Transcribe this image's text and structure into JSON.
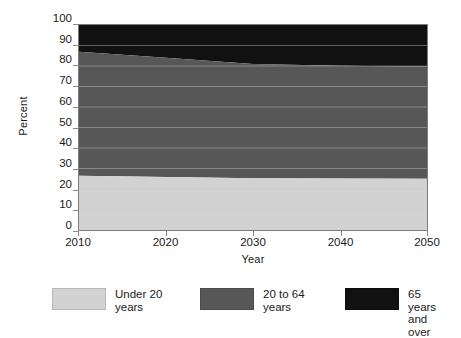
{
  "chart_data": {
    "type": "area",
    "stacked": true,
    "percent_stacked": true,
    "title": "",
    "subtitle": "",
    "xlabel": "Year",
    "ylabel": "Percent",
    "x": [
      2010,
      2020,
      2030,
      2040,
      2050
    ],
    "xlim": [
      2010,
      2050
    ],
    "ylim": [
      0,
      100
    ],
    "xticks": [
      "2010",
      "2020",
      "2030",
      "2040",
      "2050"
    ],
    "yticks": [
      "0",
      "10",
      "20",
      "30",
      "40",
      "50",
      "60",
      "70",
      "80",
      "90",
      "100"
    ],
    "grid": true,
    "grid_axis": "y",
    "legend_position": "bottom",
    "series": [
      {
        "name": "Under 20 years",
        "color": "#d2d2d2",
        "values": [
          26.5,
          25.8,
          25.3,
          25.1,
          25.0
        ]
      },
      {
        "name": "20 to 64 years",
        "color": "#575757",
        "values": [
          60.5,
          58.2,
          55.7,
          55.0,
          54.8
        ]
      },
      {
        "name": "65 years and over",
        "color": "#111111",
        "values": [
          13.0,
          16.0,
          19.0,
          19.9,
          20.2
        ]
      }
    ],
    "cumulative_upper_bounds": {
      "under_20": [
        26.5,
        25.8,
        25.3,
        25.1,
        25.0
      ],
      "through_64": [
        87.0,
        84.0,
        81.0,
        80.1,
        79.8
      ],
      "total": [
        100,
        100,
        100,
        100,
        100
      ]
    },
    "annotations": []
  },
  "axes": {
    "y_title": "Percent",
    "x_title": "Year",
    "y_ticklabels": [
      "100",
      "90",
      "80",
      "70",
      "60",
      "50",
      "40",
      "30",
      "20",
      "10",
      "0"
    ],
    "x_ticklabels": [
      "2010",
      "2020",
      "2030",
      "2040",
      "2050"
    ]
  },
  "legend": {
    "items": [
      {
        "label": "Under 20\nyears",
        "color": "#d2d2d2"
      },
      {
        "label": "20 to 64\nyears",
        "color": "#575757"
      },
      {
        "label": "65 years\nand over",
        "color": "#111111"
      }
    ]
  },
  "colors": {
    "under_20": "#d2d2d2",
    "age_20_64": "#575757",
    "age_65_plus": "#111111",
    "gridline": "#c9c9c9",
    "axis": "#7d7d7d",
    "text": "#1a1a1a",
    "background": "#ffffff"
  }
}
